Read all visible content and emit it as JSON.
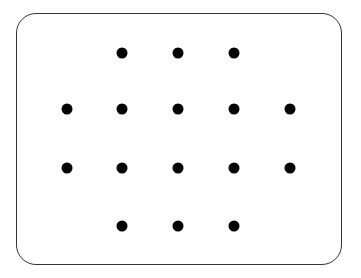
{
  "diagram": {
    "type": "dot-grid",
    "dot_color": "#000000",
    "border_color": "#333333",
    "rows": [
      {
        "y": 53,
        "xs": [
          122,
          178,
          234
        ]
      },
      {
        "y": 109,
        "xs": [
          67,
          122,
          178,
          234,
          290
        ]
      },
      {
        "y": 168,
        "xs": [
          67,
          122,
          178,
          234,
          290
        ]
      },
      {
        "y": 226,
        "xs": [
          122,
          178,
          234
        ]
      }
    ],
    "dot_count": 16
  }
}
